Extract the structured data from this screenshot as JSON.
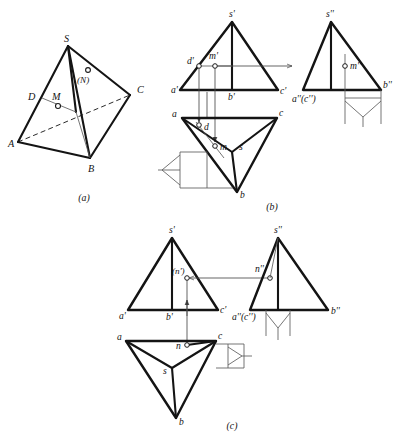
{
  "figure": {
    "background_color": "#ffffff",
    "line_color": "#141414",
    "thin_line_color": "#5c5c5c",
    "panels": [
      {
        "key": "a",
        "caption": "(a)",
        "caption_x": 84,
        "caption_y": 200
      },
      {
        "key": "b",
        "caption": "(b)",
        "caption_x": 272,
        "caption_y": 209
      },
      {
        "key": "c",
        "caption": "(c)",
        "caption_x": 232,
        "caption_y": 428
      }
    ]
  },
  "panel_a": {
    "caption": "(a)",
    "description": "Pictorial view of tetrahedron S-ABC with point M on face SAB edge-line DM and hidden point N on face SBC",
    "vertices": {
      "S": {
        "label": "S",
        "x": 68,
        "y": 46,
        "lx": 66,
        "ly": 42
      },
      "A": {
        "label": "A",
        "x": 18,
        "y": 142,
        "lx": 11,
        "ly": 146
      },
      "B": {
        "label": "B",
        "x": 90,
        "y": 158,
        "lx": 90,
        "ly": 171
      },
      "C": {
        "label": "C",
        "x": 130,
        "y": 95,
        "lx": 138,
        "ly": 93
      },
      "D": {
        "label": "D",
        "x": 42,
        "y": 98,
        "lx": 30,
        "ly": 99
      },
      "M": {
        "label": "M",
        "x": 58,
        "y": 106,
        "lx": 53,
        "ly": 98
      },
      "N": {
        "label": "(N)",
        "x": 88,
        "y": 78,
        "lx": 80,
        "ly": 90
      }
    },
    "labels": [
      "S",
      "A",
      "B",
      "C",
      "D",
      "M",
      "(N)"
    ]
  },
  "panel_b": {
    "caption": "(b)",
    "description": "Three-view projection: front view (s'a'b'c'), top view (sabc), side view (s''a''b''c'') with point M located on face SAB via auxiliary line d'-m'",
    "front_view": {
      "name": "front-view",
      "labels": [
        {
          "text": "s'",
          "x": 232,
          "y": 12
        },
        {
          "text": "d'",
          "x": 190,
          "y": 70
        },
        {
          "text": "m'",
          "x": 210,
          "y": 64
        },
        {
          "text": "a'",
          "x": 174,
          "y": 94
        },
        {
          "text": "b'",
          "x": 231,
          "y": 98
        },
        {
          "text": "c'",
          "x": 274,
          "y": 92
        }
      ]
    },
    "top_view": {
      "name": "top-view",
      "labels": [
        {
          "text": "a",
          "x": 175,
          "y": 116
        },
        {
          "text": "c",
          "x": 276,
          "y": 115
        },
        {
          "text": "d",
          "x": 208,
          "y": 127
        },
        {
          "text": "m",
          "x": 222,
          "y": 150
        },
        {
          "text": "s",
          "x": 240,
          "y": 150
        },
        {
          "text": "b",
          "x": 240,
          "y": 197
        }
      ]
    },
    "side_view": {
      "name": "side-view",
      "labels": [
        {
          "text": "s''",
          "x": 330,
          "y": 12
        },
        {
          "text": "m''",
          "x": 360,
          "y": 64
        },
        {
          "text": "a''(c'')",
          "x": 293,
          "y": 101
        },
        {
          "text": "b''",
          "x": 390,
          "y": 91
        }
      ]
    }
  },
  "panel_c": {
    "caption": "(c)",
    "description": "Three-view projection: point N located on the rear face, invisible in the front view as (n'), visible as n'' in the side view and n in the top view",
    "front_view": {
      "name": "front-view",
      "labels": [
        {
          "text": "s'",
          "x": 172,
          "y": 230
        },
        {
          "text": "(n')",
          "x": 178,
          "y": 272
        },
        {
          "text": "a'",
          "x": 124,
          "y": 316
        },
        {
          "text": "b'",
          "x": 168,
          "y": 318
        },
        {
          "text": "c'",
          "x": 216,
          "y": 311
        }
      ]
    },
    "top_view": {
      "name": "top-view",
      "labels": [
        {
          "text": "a",
          "x": 116,
          "y": 340
        },
        {
          "text": "c",
          "x": 216,
          "y": 338
        },
        {
          "text": "n",
          "x": 178,
          "y": 350
        },
        {
          "text": "s",
          "x": 164,
          "y": 370
        },
        {
          "text": "b",
          "x": 178,
          "y": 425
        }
      ]
    },
    "side_view": {
      "name": "side-view",
      "labels": [
        {
          "text": "s''",
          "x": 278,
          "y": 229
        },
        {
          "text": "n''",
          "x": 258,
          "y": 268
        },
        {
          "text": "a''(c'')",
          "x": 236,
          "y": 320
        },
        {
          "text": "b''",
          "x": 338,
          "y": 312
        }
      ]
    }
  }
}
